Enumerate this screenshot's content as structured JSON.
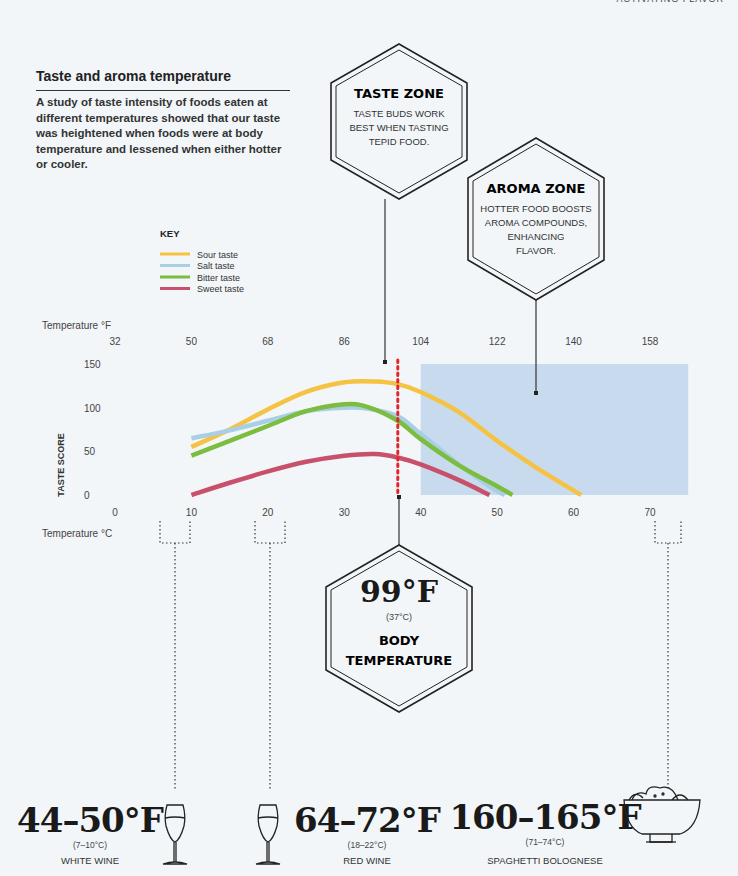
{
  "header": {
    "running_title": "ACTIVATING FLAVOR"
  },
  "section": {
    "title": "Taste and aroma temperature",
    "intro": "A study of taste intensity of foods eaten at different temperatures showed that our taste was heightened when foods were at body temperature and lessened when either hotter or cooler."
  },
  "callouts": {
    "taste_zone": {
      "title": "TASTE ZONE",
      "lines": [
        "TASTE BUDS WORK",
        "BEST WHEN TASTING",
        "TEPID FOOD."
      ]
    },
    "aroma_zone": {
      "title": "AROMA ZONE",
      "lines": [
        "HOTTER FOOD BOOSTS",
        "AROMA COMPOUNDS,",
        "ENHANCING",
        "FLAVOR."
      ]
    },
    "body_temp": {
      "value": "99°F",
      "celsius": "(37°C)",
      "lines": [
        "BODY",
        "TEMPERATURE"
      ]
    }
  },
  "examples": [
    {
      "range": "44–50°F",
      "celsius": "(7–10°C)",
      "label": "WHITE WINE",
      "icon": "white-wine-glass-icon"
    },
    {
      "range": "64–72°F",
      "celsius": "(18–22°C)",
      "label": "RED WINE",
      "icon": "red-wine-glass-icon"
    },
    {
      "range": "160–165°F",
      "celsius": "(71–74°C)",
      "label": "SPAGHETTI BOLOGNESE",
      "icon": "pasta-bowl-icon"
    }
  ],
  "colors": {
    "sour": "#f5c242",
    "salt": "#a9cfe4",
    "bitter": "#7cbc3e",
    "sweet": "#c9506b",
    "aroma_zone": "#c8dbee",
    "body_line": "#e0262b"
  },
  "chart_data": {
    "type": "line",
    "title": "Taste and aroma temperature",
    "xlabel": "Temperature °C",
    "x2label": "Temperature °F",
    "ylabel": "TASTE SCORE",
    "xlim": [
      0,
      75
    ],
    "ylim": [
      0,
      150
    ],
    "x_ticks": [
      0,
      10,
      20,
      30,
      40,
      50,
      60,
      70
    ],
    "x2_ticks": [
      32,
      50,
      68,
      86,
      104,
      122,
      140,
      158
    ],
    "y_ticks": [
      0,
      50,
      100,
      150
    ],
    "legend_title": "KEY",
    "legend_position": "top-left",
    "grid": false,
    "series": [
      {
        "name": "Sour taste",
        "color": "#f5c242",
        "x": [
          10,
          15,
          20,
          25,
          30,
          34,
          37,
          40,
          45,
          50,
          55,
          61
        ],
        "y": [
          55,
          75,
          98,
          118,
          129,
          130,
          127,
          118,
          95,
          62,
          32,
          0
        ]
      },
      {
        "name": "Salt taste",
        "color": "#a9cfe4",
        "x": [
          10,
          15,
          20,
          25,
          30,
          33,
          37,
          40,
          45,
          49,
          51
        ],
        "y": [
          65,
          74,
          85,
          96,
          100,
          99,
          90,
          70,
          35,
          10,
          0
        ]
      },
      {
        "name": "Bitter taste",
        "color": "#7cbc3e",
        "x": [
          10,
          15,
          20,
          25,
          30,
          33,
          37,
          40,
          45,
          50,
          52
        ],
        "y": [
          45,
          62,
          79,
          96,
          104,
          101,
          85,
          64,
          34,
          10,
          0
        ]
      },
      {
        "name": "Sweet taste",
        "color": "#c9506b",
        "x": [
          10,
          15,
          20,
          25,
          30,
          34,
          37,
          40,
          45,
          49
        ],
        "y": [
          0,
          14,
          27,
          38,
          45,
          47,
          43,
          35,
          17,
          0
        ]
      }
    ],
    "annotations": [
      {
        "type": "band",
        "label": "AROMA ZONE",
        "x_range": [
          40,
          75
        ]
      },
      {
        "type": "vline",
        "label": "Body temperature",
        "x": 37
      }
    ]
  }
}
